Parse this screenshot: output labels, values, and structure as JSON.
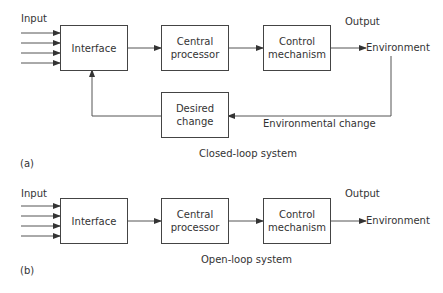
{
  "diagram_a": {
    "caption": "Closed-loop system",
    "tag": "(a)",
    "input_label": "Input",
    "output_label": "Output",
    "environment_label": "Environment",
    "feedback_label": "Environmental change",
    "boxes": {
      "interface": "Interface",
      "central_processor_1": "Central",
      "central_processor_2": "processor",
      "control_mechanism_1": "Control",
      "control_mechanism_2": "mechanism",
      "desired_change_1": "Desired",
      "desired_change_2": "change"
    },
    "input_arrow_count": 4
  },
  "diagram_b": {
    "caption": "Open-loop system",
    "tag": "(b)",
    "input_label": "Input",
    "output_label": "Output",
    "environment_label": "Environment",
    "boxes": {
      "interface": "Interface",
      "central_processor_1": "Central",
      "central_processor_2": "processor",
      "control_mechanism_1": "Control",
      "control_mechanism_2": "mechanism"
    },
    "input_arrow_count": 4
  }
}
